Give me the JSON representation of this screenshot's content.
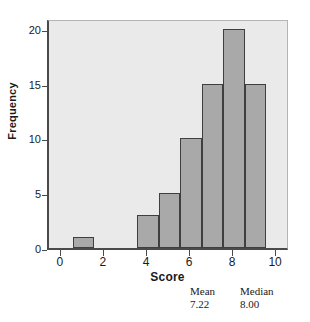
{
  "chart_data": {
    "type": "bar",
    "title": "",
    "xlabel": "Score",
    "ylabel": "Frequency",
    "xlim": [
      -0.6,
      10.6
    ],
    "ylim": [
      0,
      21
    ],
    "xticks": [
      "0",
      "2",
      "4",
      "6",
      "8",
      "10"
    ],
    "xtick_values": [
      0,
      2,
      4,
      6,
      8,
      10
    ],
    "yticks": [
      "0",
      "5",
      "10",
      "15",
      "20"
    ],
    "ytick_values": [
      0,
      5,
      10,
      15,
      20
    ],
    "grid": false,
    "legend": null,
    "bin_width": 1,
    "categories": [
      1,
      4,
      5,
      6,
      7,
      8,
      9
    ],
    "values": [
      1,
      3,
      5,
      10,
      15,
      20,
      15
    ],
    "bars": [
      {
        "center": 1,
        "bin_start": 0.5,
        "bin_end": 1.5,
        "value": 1
      },
      {
        "center": 4,
        "bin_start": 3.5,
        "bin_end": 4.5,
        "value": 3
      },
      {
        "center": 5,
        "bin_start": 4.5,
        "bin_end": 5.5,
        "value": 5
      },
      {
        "center": 6,
        "bin_start": 5.5,
        "bin_end": 6.5,
        "value": 10
      },
      {
        "center": 7,
        "bin_start": 6.5,
        "bin_end": 7.5,
        "value": 15
      },
      {
        "center": 8,
        "bin_start": 7.5,
        "bin_end": 8.5,
        "value": 20
      },
      {
        "center": 9,
        "bin_start": 8.5,
        "bin_end": 9.5,
        "value": 15
      }
    ],
    "annotations": [
      {
        "name": "Mean",
        "value": "7.22"
      },
      {
        "name": "Median",
        "value": "8.00"
      }
    ],
    "colors": {
      "bar_fill": "#a9a9a9",
      "bar_edge": "#3f3f3f",
      "plot_background": "#eaeaea",
      "axis": "#4a4a4a",
      "text": "#1a1a1a"
    }
  }
}
